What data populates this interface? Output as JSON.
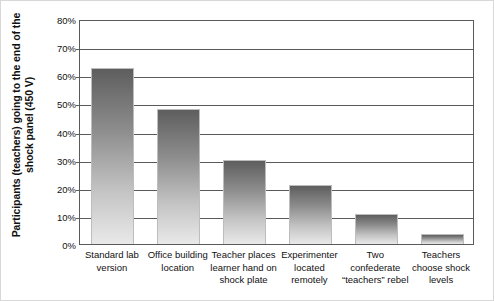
{
  "chart_data": {
    "type": "bar",
    "title": "",
    "xlabel": "",
    "ylabel": "Participants (teachers) going to the end of the shock panel (450 V)",
    "ylabel_line1": "Participants (teachers) going to the end of the",
    "ylabel_line2": "shock panel (450 V)",
    "ylim": [
      0,
      80
    ],
    "ytick_values": [
      0,
      10,
      20,
      30,
      40,
      50,
      60,
      70,
      80
    ],
    "ytick_labels": [
      "0%",
      "10%",
      "20%",
      "30%",
      "40%",
      "50%",
      "60%",
      "70%",
      "80%"
    ],
    "grid": true,
    "legend": "none",
    "categories": [
      "Standard lab version",
      "Office building location",
      "Teacher places learner hand on shock plate",
      "Experimenter located remotely",
      "Two confederate “teachers” rebel",
      "Teachers choose shock levels"
    ],
    "category_lines": [
      [
        "Standard lab",
        "version"
      ],
      [
        "Office building",
        "location"
      ],
      [
        "Teacher places",
        "learner hand on",
        "shock plate"
      ],
      [
        "Experimenter",
        "located",
        "remotely"
      ],
      [
        "Two",
        "confederate",
        "“teachers” rebel"
      ],
      [
        "Teachers",
        "choose shock",
        "levels"
      ]
    ],
    "values": [
      62.5,
      48,
      30,
      21,
      10.5,
      3.5
    ],
    "bar_gradient_top": "#5e5e5e",
    "bar_gradient_bottom": "#e9e9e9",
    "axis_color": "#5a5a5a"
  }
}
